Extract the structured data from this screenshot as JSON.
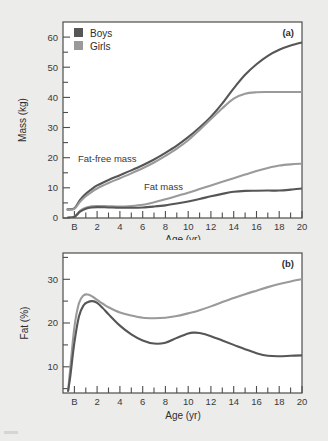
{
  "figure": {
    "panel_a_tag": "(a)",
    "panel_b_tag": "(b)",
    "legend": {
      "boys_label": "Boys",
      "girls_label": "Girls",
      "boys_color": "#565656",
      "girls_color": "#9a9a9a"
    },
    "annotations": {
      "fat_free_mass": "Fat-free mass",
      "fat_mass": "Fat mass"
    }
  },
  "chart_data": [
    {
      "type": "line",
      "title": "",
      "panel": "(a)",
      "xlabel": "Age (yr)",
      "ylabel": "Mass (kg)",
      "xlim": [
        -1,
        20
      ],
      "ylim": [
        0,
        65
      ],
      "xtick_labels": [
        "B",
        "2",
        "4",
        "6",
        "8",
        "10",
        "12",
        "14",
        "16",
        "18",
        "20"
      ],
      "xtick_values": [
        0,
        2,
        4,
        6,
        8,
        10,
        12,
        14,
        16,
        18,
        20
      ],
      "ytick_labels": [
        "0",
        "10",
        "20",
        "30",
        "40",
        "50",
        "60"
      ],
      "ytick_values": [
        0,
        10,
        20,
        30,
        40,
        50,
        60
      ],
      "minor_xticks": true,
      "minor_yticks": true,
      "grid": false,
      "legend_position": "top-left",
      "annotations": [
        "Fat-free mass",
        "Fat mass"
      ],
      "x": [
        -0.6,
        0,
        0.5,
        1,
        1.5,
        2,
        3,
        4,
        5,
        6,
        7,
        8,
        9,
        10,
        11,
        12,
        13,
        14,
        15,
        16,
        17,
        18,
        19,
        20
      ],
      "series": [
        {
          "name": "Boys fat-free mass",
          "color": "#565656",
          "values": [
            2.9,
            3.2,
            6.0,
            8.0,
            9.5,
            10.8,
            12.6,
            14.2,
            15.8,
            17.5,
            19.4,
            21.6,
            24.0,
            26.8,
            30.0,
            33.6,
            38.0,
            43.0,
            47.5,
            51.0,
            53.8,
            55.8,
            57.2,
            58.2
          ]
        },
        {
          "name": "Girls fat-free mass",
          "color": "#9a9a9a",
          "values": [
            2.7,
            3.0,
            5.4,
            7.2,
            8.6,
            9.8,
            11.6,
            13.2,
            14.8,
            16.5,
            18.4,
            20.6,
            23.0,
            25.8,
            29.2,
            32.8,
            36.4,
            39.6,
            41.2,
            41.7,
            41.8,
            41.8,
            41.8,
            41.8
          ]
        },
        {
          "name": "Girls fat mass",
          "color": "#9a9a9a",
          "values": [
            0.1,
            0.4,
            2.4,
            3.4,
            3.9,
            4.0,
            3.9,
            3.8,
            4.0,
            4.4,
            5.2,
            6.2,
            7.3,
            8.4,
            9.6,
            10.8,
            12.0,
            13.2,
            14.4,
            15.6,
            16.6,
            17.4,
            17.8,
            18.0
          ]
        },
        {
          "name": "Boys fat mass",
          "color": "#565656",
          "values": [
            0.1,
            0.35,
            2.1,
            3.1,
            3.5,
            3.6,
            3.5,
            3.4,
            3.4,
            3.5,
            3.8,
            4.2,
            4.8,
            5.5,
            6.3,
            7.2,
            8.0,
            8.7,
            9.0,
            9.05,
            9.1,
            9.1,
            9.4,
            9.8
          ]
        }
      ]
    },
    {
      "type": "line",
      "title": "",
      "panel": "(b)",
      "xlabel": "Age (yr)",
      "ylabel": "Fat (%)",
      "xlim": [
        -1,
        20
      ],
      "ylim": [
        4,
        36
      ],
      "xtick_labels": [
        "B",
        "2",
        "4",
        "6",
        "8",
        "10",
        "12",
        "14",
        "16",
        "18",
        "20"
      ],
      "xtick_values": [
        0,
        2,
        4,
        6,
        8,
        10,
        12,
        14,
        16,
        18,
        20
      ],
      "ytick_labels": [
        "10",
        "20",
        "30"
      ],
      "ytick_values": [
        10,
        20,
        30
      ],
      "minor_xticks": true,
      "minor_yticks": true,
      "grid": false,
      "legend_position": "none",
      "x": [
        -0.55,
        -0.35,
        0,
        0.4,
        0.8,
        1.2,
        1.6,
        2,
        2.5,
        3,
        4,
        5,
        6,
        7,
        8,
        9,
        10,
        10.5,
        11,
        12,
        13,
        14,
        15,
        16,
        17,
        18,
        19,
        20
      ],
      "series": [
        {
          "name": "Girls fat percent",
          "color": "#9a9a9a",
          "values": [
            4.5,
            10.0,
            19.0,
            24.5,
            26.3,
            26.5,
            26.0,
            25.3,
            24.4,
            23.6,
            22.4,
            21.7,
            21.2,
            21.1,
            21.2,
            21.6,
            22.2,
            22.5,
            22.9,
            23.8,
            24.8,
            25.7,
            26.6,
            27.4,
            28.2,
            28.9,
            29.5,
            30.0
          ]
        },
        {
          "name": "Boys fat percent",
          "color": "#565656",
          "values": [
            4.5,
            8.0,
            15.5,
            21.5,
            24.0,
            24.8,
            25.0,
            24.6,
            23.4,
            22.0,
            19.4,
            17.4,
            16.0,
            15.3,
            15.5,
            16.6,
            17.6,
            17.8,
            17.7,
            17.0,
            16.0,
            15.0,
            14.0,
            13.1,
            12.5,
            12.4,
            12.5,
            12.6
          ]
        }
      ]
    }
  ]
}
